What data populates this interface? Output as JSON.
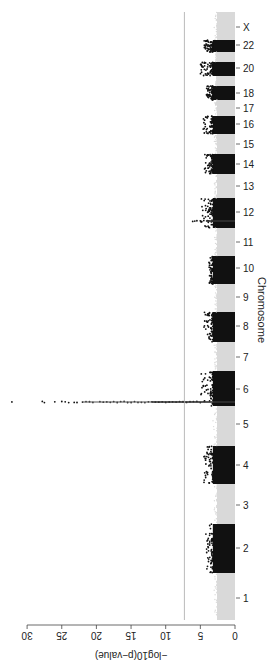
{
  "chart_data": {
    "type": "scatter",
    "subtype": "manhattan",
    "orientation": "rotated-90-ccw",
    "title": "",
    "xlabel": "Chromosome",
    "ylabel": "−log10(p−value)",
    "ylim": [
      0,
      30
    ],
    "y_ticks": [
      0,
      5,
      10,
      15,
      20,
      25,
      30
    ],
    "significance_threshold": 7.3,
    "threshold_line_color": "#aaaaaa",
    "grid": false,
    "legend": null,
    "colors": {
      "odd_chromosome": "#d9d9d9",
      "even_chromosome": "#111111"
    },
    "categories": [
      "1",
      "2",
      "3",
      "4",
      "5",
      "6",
      "7",
      "8",
      "9",
      "10",
      "11",
      "12",
      "13",
      "14",
      "15",
      "16",
      "17",
      "18",
      "20",
      "22",
      "X"
    ],
    "chromosome_tick_x": [
      68,
      118,
      161,
      201,
      242,
      277,
      309,
      340,
      369,
      398,
      424,
      454,
      480,
      502,
      522,
      542,
      558,
      573,
      598,
      621,
      639
    ],
    "chromosome_bands": [
      {
        "chr": "1",
        "x0": 46,
        "x1": 93,
        "shade": "light",
        "max": 3.0
      },
      {
        "chr": "2",
        "x0": 93,
        "x1": 142,
        "shade": "dark",
        "max": 4.2
      },
      {
        "chr": "3",
        "x0": 142,
        "x1": 182,
        "shade": "light",
        "max": 3.0
      },
      {
        "chr": "4",
        "x0": 182,
        "x1": 220,
        "shade": "dark",
        "max": 4.5
      },
      {
        "chr": "5",
        "x0": 220,
        "x1": 260,
        "shade": "light",
        "max": 3.2
      },
      {
        "chr": "6",
        "x0": 260,
        "x1": 295,
        "shade": "dark",
        "max": 32.0
      },
      {
        "chr": "7",
        "x0": 295,
        "x1": 324,
        "shade": "light",
        "max": 3.0
      },
      {
        "chr": "8",
        "x0": 324,
        "x1": 354,
        "shade": "dark",
        "max": 4.5
      },
      {
        "chr": "9",
        "x0": 354,
        "x1": 382,
        "shade": "light",
        "max": 3.0
      },
      {
        "chr": "10",
        "x0": 382,
        "x1": 410,
        "shade": "dark",
        "max": 3.8
      },
      {
        "chr": "11",
        "x0": 410,
        "x1": 438,
        "shade": "light",
        "max": 3.0
      },
      {
        "chr": "12",
        "x0": 438,
        "x1": 468,
        "shade": "dark",
        "max": 6.1
      },
      {
        "chr": "13",
        "x0": 468,
        "x1": 492,
        "shade": "light",
        "max": 3.0
      },
      {
        "chr": "14",
        "x0": 492,
        "x1": 512,
        "shade": "dark",
        "max": 4.5
      },
      {
        "chr": "15",
        "x0": 512,
        "x1": 532,
        "shade": "light",
        "max": 3.0
      },
      {
        "chr": "16",
        "x0": 532,
        "x1": 550,
        "shade": "dark",
        "max": 4.6
      },
      {
        "chr": "17",
        "x0": 550,
        "x1": 566,
        "shade": "light",
        "max": 3.0
      },
      {
        "chr": "18",
        "x0": 566,
        "x1": 580,
        "shade": "dark",
        "max": 4.3
      },
      {
        "chr": "19",
        "x0": 580,
        "x1": 590,
        "shade": "light",
        "max": 2.8
      },
      {
        "chr": "20",
        "x0": 590,
        "x1": 604,
        "shade": "dark",
        "max": 5.0
      },
      {
        "chr": "21",
        "x0": 604,
        "x1": 614,
        "shade": "light",
        "max": 2.8
      },
      {
        "chr": "22",
        "x0": 614,
        "x1": 626,
        "shade": "dark",
        "max": 4.6
      },
      {
        "chr": "X",
        "x0": 626,
        "x1": 654,
        "shade": "light",
        "max": 3.0
      }
    ],
    "peaks": [
      {
        "chr": "6",
        "pos_x": 264,
        "values": [
          32.2,
          27.8,
          27.5,
          26.0,
          25.0,
          24.5,
          24.0,
          23.2,
          22.8,
          22.0,
          21.5,
          21.0,
          20.5,
          19.5,
          19.0,
          18.5,
          18.0,
          17.5,
          17.0,
          16.5,
          16.0,
          15.5,
          15.0,
          14.5,
          14.0,
          13.5,
          13.0,
          12.5,
          12.0,
          11.5,
          11.0,
          10.5,
          10.0,
          9.5,
          9.0,
          8.5,
          8.0,
          7.5,
          7.0,
          6.5,
          6.0,
          5.5,
          5.0
        ]
      },
      {
        "chr": "12",
        "pos_x": 445,
        "values": [
          6.1,
          5.8,
          5.5,
          5.0,
          4.5,
          4.0,
          3.8
        ]
      }
    ],
    "y_axis_px": {
      "zero": 235,
      "per_unit": 6.93
    }
  },
  "labels": {
    "xlabel": "Chromosome",
    "ylabel": "−log10(p−value)"
  }
}
